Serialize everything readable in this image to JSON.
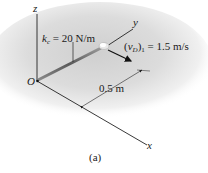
{
  "figure": {
    "caption": "(a)",
    "axes": {
      "z_label": "z",
      "y_label": "y",
      "x_label": "x",
      "origin_label": "O"
    },
    "spring": {
      "symbol": "k",
      "subscript": "c",
      "equals_value": "= 20 N/m"
    },
    "velocity": {
      "open": "(",
      "symbol": "v",
      "subscript": "D",
      "close": ")",
      "index": "1",
      "equals_value": "= 1.5 m/s"
    },
    "dimension": {
      "length": "0.5 m"
    },
    "colors": {
      "background_shadow": "#c8c8c8",
      "rod": "#6b6b6b",
      "lines": "#222222"
    }
  }
}
